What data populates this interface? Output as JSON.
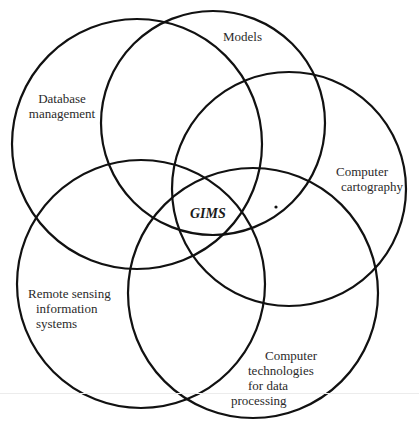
{
  "diagram": {
    "type": "venn",
    "center_label": "GIMS",
    "stroke_color": "#111111",
    "background": "#ffffff",
    "sets": [
      {
        "id": "database",
        "lines": [
          "Database",
          "management"
        ],
        "circle": {
          "cx": 137,
          "cy": 144,
          "r": 125
        }
      },
      {
        "id": "models",
        "lines": [
          "Models"
        ],
        "circle": {
          "cx": 213,
          "cy": 123,
          "r": 112
        }
      },
      {
        "id": "cartography",
        "lines": [
          "Computer",
          "cartography"
        ],
        "circle": {
          "cx": 289,
          "cy": 189,
          "r": 117
        }
      },
      {
        "id": "remote-sensing",
        "lines": [
          "Remote sensing",
          "information",
          "systems"
        ],
        "circle": {
          "cx": 141,
          "cy": 284,
          "r": 124
        }
      },
      {
        "id": "data-processing",
        "lines": [
          "Computer",
          "technologies",
          "for data",
          "processing"
        ],
        "circle": {
          "cx": 253,
          "cy": 293,
          "r": 125
        }
      }
    ]
  }
}
